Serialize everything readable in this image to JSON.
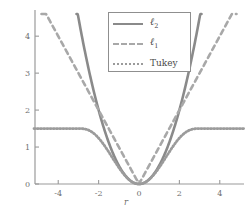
{
  "chart_data": {
    "type": "line",
    "title": "",
    "subtitle": "",
    "xlabel": "r",
    "ylabel": "",
    "xlim": [
      -5.2,
      5.2
    ],
    "ylim": [
      0,
      4.6
    ],
    "xticks": [
      -4,
      -2,
      0,
      2,
      4
    ],
    "xtick_labels": [
      "-4",
      "-2",
      "0",
      "2",
      "4"
    ],
    "yticks": [
      0,
      1,
      2,
      3,
      4
    ],
    "ytick_labels": [
      "0",
      "1",
      "2",
      "3",
      "4"
    ],
    "grid": false,
    "legend_position": "top-center",
    "series": [
      {
        "name": "l2",
        "label": "ℓ",
        "label_sub": "2",
        "style": "solid",
        "color": "#8a8a8a",
        "formula": "r^2 / 2",
        "x": [
          -5.0,
          -4.5,
          -4.0,
          -3.5,
          -3.0,
          -2.5,
          -2.0,
          -1.5,
          -1.0,
          -0.5,
          0.0,
          0.5,
          1.0,
          1.5,
          2.0,
          2.5,
          3.0,
          3.5,
          4.0,
          4.5,
          5.0
        ],
        "y": [
          12.5,
          10.125,
          8.0,
          6.125,
          4.5,
          3.125,
          2.0,
          1.125,
          0.5,
          0.125,
          0.0,
          0.125,
          0.5,
          1.125,
          2.0,
          3.125,
          4.5,
          6.125,
          8.0,
          10.125,
          12.5
        ]
      },
      {
        "name": "l1",
        "label": "ℓ",
        "label_sub": "1",
        "style": "dashed",
        "color": "#a8a8a8",
        "formula": "|r|",
        "x": [
          -5.0,
          -4.5,
          -4.0,
          -3.5,
          -3.0,
          -2.5,
          -2.0,
          -1.5,
          -1.0,
          -0.5,
          0.0,
          0.5,
          1.0,
          1.5,
          2.0,
          2.5,
          3.0,
          3.5,
          4.0,
          4.5,
          5.0
        ],
        "y": [
          5.0,
          4.5,
          4.0,
          3.5,
          3.0,
          2.5,
          2.0,
          1.5,
          1.0,
          0.5,
          0.0,
          0.5,
          1.0,
          1.5,
          2.0,
          2.5,
          3.0,
          3.5,
          4.0,
          4.5,
          5.0
        ]
      },
      {
        "name": "tukey",
        "label": "Tukey",
        "label_sub": "",
        "style": "dotted",
        "color": "#9b9b9b",
        "formula": "c^2/6 * (1 - (1-(r/c)^2)^3) for |r|<=c else c^2/6, c=3",
        "plateau": 1.5,
        "x": [
          -5.0,
          -4.5,
          -4.0,
          -3.5,
          -3.0,
          -2.5,
          -2.0,
          -1.5,
          -1.0,
          -0.5,
          0.0,
          0.5,
          1.0,
          1.5,
          2.0,
          2.5,
          3.0,
          3.5,
          4.0,
          4.5,
          5.0
        ],
        "y": [
          1.5,
          1.5,
          1.5,
          1.5,
          1.5,
          1.447,
          1.284,
          1.012,
          0.644,
          0.214,
          0.0,
          0.214,
          0.644,
          1.012,
          1.284,
          1.447,
          1.5,
          1.5,
          1.5,
          1.5,
          1.5
        ]
      }
    ]
  },
  "axes": {
    "x_title": "r",
    "x_tick_labels": [
      "-4",
      "-2",
      "0",
      "2",
      "4"
    ],
    "y_tick_labels": [
      "0",
      "1",
      "2",
      "3",
      "4"
    ],
    "axis_color": "#9a9a9a"
  },
  "legend": {
    "border_color": "#8f8f8f",
    "background": "#ffffff",
    "entries": [
      {
        "label": "ℓ",
        "sub": "2",
        "style": "solid",
        "color": "#8a8a8a"
      },
      {
        "label": "ℓ",
        "sub": "1",
        "style": "dashed",
        "color": "#a8a8a8"
      },
      {
        "label": "Tukey",
        "sub": "",
        "style": "dotted",
        "color": "#9b9b9b"
      }
    ]
  },
  "colors": {
    "background": "#ffffff",
    "axis": "#9a9a9a",
    "text": "#6f6f6f",
    "l2": "#8a8a8a",
    "l1": "#a8a8a8",
    "tukey": "#9b9b9b"
  }
}
